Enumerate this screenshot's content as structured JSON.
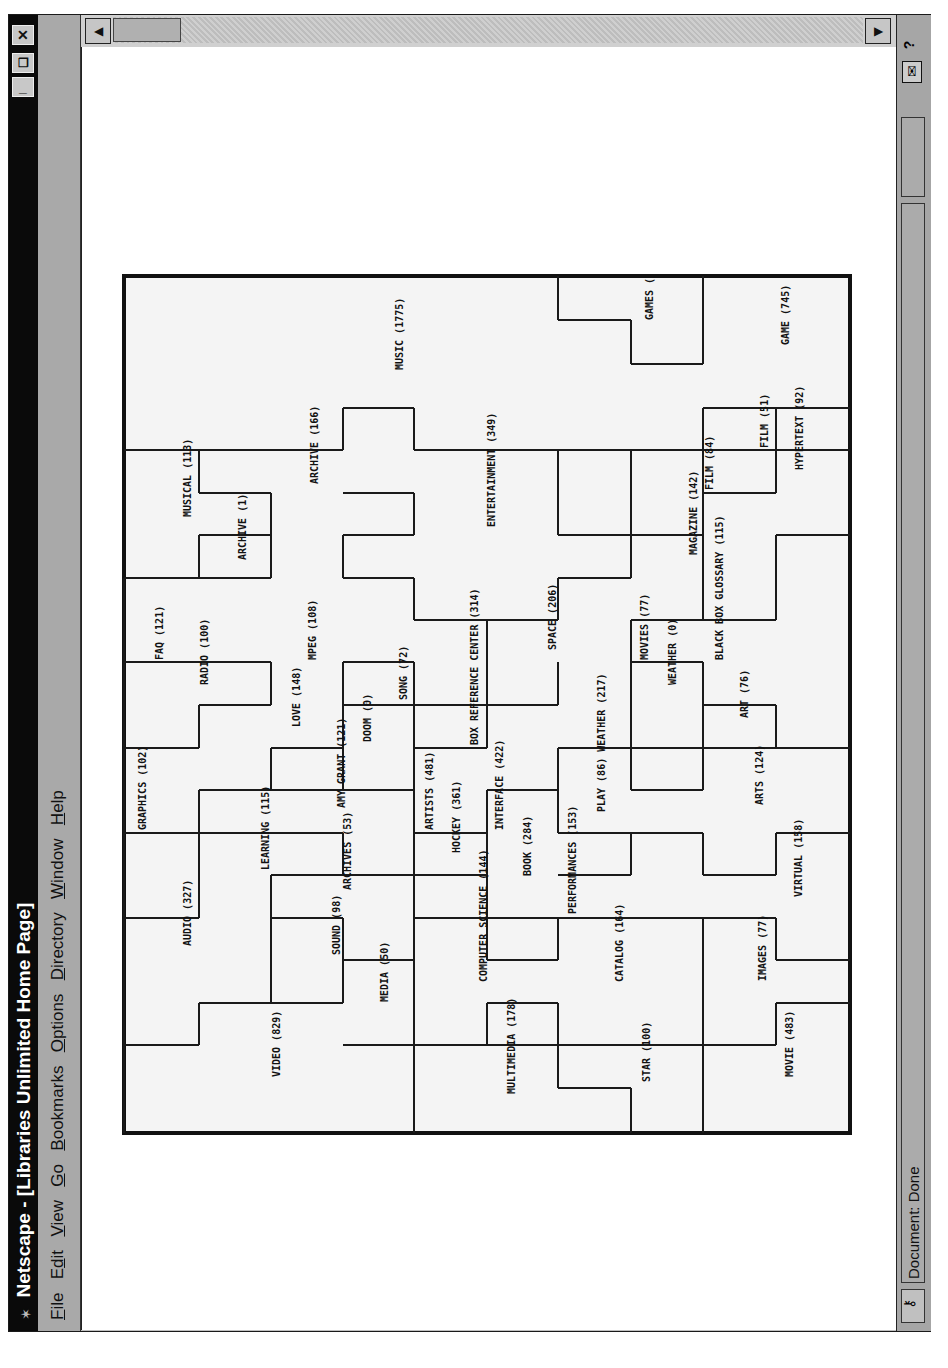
{
  "window": {
    "title": "Netscape - [Libraries Unlimited Home Page]",
    "controls": {
      "minimize": "_",
      "restore": "❐",
      "close": "✕"
    }
  },
  "menubar": {
    "items": [
      {
        "label": "File",
        "mnemonic": "F"
      },
      {
        "label": "Edit",
        "mnemonic": "d"
      },
      {
        "label": "View",
        "mnemonic": "V"
      },
      {
        "label": "Go",
        "mnemonic": "G"
      },
      {
        "label": "Bookmarks",
        "mnemonic": "B"
      },
      {
        "label": "Options",
        "mnemonic": "O"
      },
      {
        "label": "Directory",
        "mnemonic": "D"
      },
      {
        "label": "Window",
        "mnemonic": "W"
      },
      {
        "label": "Help",
        "mnemonic": "H"
      }
    ]
  },
  "statusbar": {
    "text": "Document: Done",
    "security_icon": "broken-key-icon",
    "mail_icon": "envelope-icon",
    "help_icon": "question-icon"
  },
  "scrollbar": {
    "left_arrow": "◀",
    "right_arrow": "▶"
  },
  "map": {
    "title": "Topic map",
    "colors": {
      "line": "#1a1a1a",
      "background": "#f4f4f4",
      "border": "#111111"
    },
    "labels": [
      {
        "text": "MUSIC (1775)",
        "x": 400,
        "y": 370
      },
      {
        "text": "GAMES (",
        "x": 650,
        "y": 320
      },
      {
        "text": "GAME (745)",
        "x": 786,
        "y": 345
      },
      {
        "text": "MUSICAL (113)",
        "x": 188,
        "y": 517
      },
      {
        "text": "ARCHIVE (166)",
        "x": 315,
        "y": 484
      },
      {
        "text": "ARCHIVE (1)",
        "x": 243,
        "y": 560
      },
      {
        "text": "ENTERTAINMENT (349)",
        "x": 492,
        "y": 527
      },
      {
        "text": "FILM (51)",
        "x": 765,
        "y": 448
      },
      {
        "text": "HYPERTEXT (92)",
        "x": 800,
        "y": 470
      },
      {
        "text": "FILM (84)",
        "x": 710,
        "y": 490
      },
      {
        "text": "MAGAZINE (142)",
        "x": 694,
        "y": 555
      },
      {
        "text": "BLACK BOX GLOSSARY (115)",
        "x": 720,
        "y": 660
      },
      {
        "text": "FAQ (121)",
        "x": 160,
        "y": 660
      },
      {
        "text": "RADIO (100)",
        "x": 205,
        "y": 685
      },
      {
        "text": "MPEG (108)",
        "x": 313,
        "y": 660
      },
      {
        "text": "BOX REFERENCE CENTER (314)",
        "x": 475,
        "y": 745
      },
      {
        "text": "SPACE (206)",
        "x": 553,
        "y": 650
      },
      {
        "text": "MOVIES (77)",
        "x": 645,
        "y": 660
      },
      {
        "text": "WEATHER (0)",
        "x": 673,
        "y": 685
      },
      {
        "text": "LOVE (148)",
        "x": 297,
        "y": 727
      },
      {
        "text": "SONG (72)",
        "x": 404,
        "y": 700
      },
      {
        "text": "DOOM (0)",
        "x": 368,
        "y": 742
      },
      {
        "text": "AMY GRANT (121)",
        "x": 342,
        "y": 808
      },
      {
        "text": "ART (76)",
        "x": 745,
        "y": 718
      },
      {
        "text": "PLAY (86) WEATHER (217)",
        "x": 602,
        "y": 812
      },
      {
        "text": "GRAPHICS (102)",
        "x": 143,
        "y": 830
      },
      {
        "text": "LEARNING (115)",
        "x": 266,
        "y": 870
      },
      {
        "text": "ARTISTS (481)",
        "x": 430,
        "y": 830
      },
      {
        "text": "HOCKEY (361)",
        "x": 457,
        "y": 853
      },
      {
        "text": "INTERFACE (422)",
        "x": 500,
        "y": 830
      },
      {
        "text": "ARTS (124)",
        "x": 760,
        "y": 805
      },
      {
        "text": "ARCHIVES (53)",
        "x": 348,
        "y": 890
      },
      {
        "text": "BOOK (284)",
        "x": 528,
        "y": 876
      },
      {
        "text": "PERFORMANCES (153)",
        "x": 573,
        "y": 914
      },
      {
        "text": "AUDIO (327)",
        "x": 188,
        "y": 946
      },
      {
        "text": "SOUND (98)",
        "x": 337,
        "y": 955
      },
      {
        "text": "COMPUTER SCIENCE (144)",
        "x": 484,
        "y": 982
      },
      {
        "text": "VIRTUAL (158)",
        "x": 799,
        "y": 897
      },
      {
        "text": "CATALOG (164)",
        "x": 620,
        "y": 982
      },
      {
        "text": "IMAGES (77)",
        "x": 763,
        "y": 981
      },
      {
        "text": "MEDIA (50)",
        "x": 385,
        "y": 1002
      },
      {
        "text": "VIDEO (829)",
        "x": 277,
        "y": 1077
      },
      {
        "text": "MULTIMEDIA (178)",
        "x": 512,
        "y": 1094
      },
      {
        "text": "STAR (100)",
        "x": 647,
        "y": 1082
      },
      {
        "text": "MOVIE (483)",
        "x": 790,
        "y": 1077
      }
    ],
    "segments": [
      [
        124,
        450,
        343,
        450
      ],
      [
        343,
        450,
        343,
        408
      ],
      [
        343,
        408,
        414,
        408
      ],
      [
        414,
        408,
        414,
        450
      ],
      [
        414,
        450,
        850,
        450
      ],
      [
        199,
        450,
        199,
        493
      ],
      [
        199,
        493,
        271,
        493
      ],
      [
        271,
        493,
        271,
        535
      ],
      [
        271,
        535,
        199,
        535
      ],
      [
        199,
        535,
        199,
        578
      ],
      [
        124,
        578,
        271,
        578
      ],
      [
        271,
        578,
        271,
        535
      ],
      [
        343,
        493,
        414,
        493
      ],
      [
        414,
        493,
        414,
        535
      ],
      [
        414,
        535,
        343,
        535
      ],
      [
        343,
        535,
        343,
        578
      ],
      [
        343,
        578,
        414,
        578
      ],
      [
        414,
        578,
        414,
        620
      ],
      [
        414,
        620,
        558,
        620
      ],
      [
        558,
        620,
        558,
        578
      ],
      [
        558,
        578,
        631,
        578
      ],
      [
        631,
        578,
        631,
        535
      ],
      [
        631,
        535,
        703,
        535
      ],
      [
        703,
        535,
        703,
        493
      ],
      [
        703,
        493,
        776,
        493
      ],
      [
        776,
        493,
        776,
        408
      ],
      [
        703,
        408,
        850,
        408
      ],
      [
        703,
        408,
        703,
        620
      ],
      [
        703,
        450,
        776,
        450
      ],
      [
        558,
        535,
        631,
        535
      ],
      [
        631,
        535,
        631,
        450
      ],
      [
        558,
        450,
        558,
        535
      ],
      [
        558,
        320,
        631,
        320
      ],
      [
        631,
        320,
        631,
        364
      ],
      [
        631,
        364,
        703,
        364
      ],
      [
        703,
        364,
        703,
        276
      ],
      [
        558,
        276,
        558,
        320
      ],
      [
        776,
        535,
        850,
        535
      ],
      [
        776,
        535,
        776,
        620
      ],
      [
        703,
        620,
        776,
        620
      ],
      [
        124,
        662,
        199,
        662
      ],
      [
        199,
        662,
        271,
        662
      ],
      [
        271,
        662,
        271,
        705
      ],
      [
        271,
        705,
        199,
        705
      ],
      [
        199,
        705,
        199,
        748
      ],
      [
        124,
        748,
        199,
        748
      ],
      [
        124,
        578,
        124,
        1133
      ],
      [
        343,
        662,
        414,
        662
      ],
      [
        343,
        662,
        343,
        790
      ],
      [
        343,
        705,
        414,
        705
      ],
      [
        414,
        662,
        414,
        748
      ],
      [
        414,
        748,
        487,
        748
      ],
      [
        487,
        705,
        487,
        748
      ],
      [
        487,
        705,
        558,
        705
      ],
      [
        558,
        705,
        558,
        662
      ],
      [
        414,
        705,
        487,
        705
      ],
      [
        487,
        620,
        487,
        705
      ],
      [
        631,
        620,
        631,
        748
      ],
      [
        631,
        620,
        703,
        620
      ],
      [
        631,
        662,
        703,
        662
      ],
      [
        703,
        662,
        703,
        748
      ],
      [
        703,
        705,
        776,
        705
      ],
      [
        776,
        705,
        776,
        748
      ],
      [
        776,
        748,
        850,
        748
      ],
      [
        631,
        748,
        776,
        748
      ],
      [
        199,
        790,
        271,
        790
      ],
      [
        199,
        790,
        199,
        918
      ],
      [
        271,
        790,
        343,
        790
      ],
      [
        271,
        748,
        271,
        790
      ],
      [
        271,
        748,
        343,
        748
      ],
      [
        343,
        790,
        414,
        790
      ],
      [
        414,
        748,
        414,
        1133
      ],
      [
        414,
        833,
        487,
        833
      ],
      [
        487,
        790,
        487,
        875
      ],
      [
        487,
        790,
        558,
        790
      ],
      [
        558,
        748,
        558,
        833
      ],
      [
        558,
        748,
        631,
        748
      ],
      [
        631,
        748,
        631,
        790
      ],
      [
        631,
        790,
        703,
        790
      ],
      [
        703,
        790,
        703,
        748
      ],
      [
        124,
        833,
        343,
        833
      ],
      [
        343,
        833,
        343,
        875
      ],
      [
        271,
        875,
        414,
        875
      ],
      [
        271,
        875,
        271,
        1003
      ],
      [
        271,
        918,
        343,
        918
      ],
      [
        343,
        918,
        343,
        1003
      ],
      [
        343,
        960,
        414,
        960
      ],
      [
        199,
        918,
        124,
        918
      ],
      [
        414,
        875,
        487,
        875
      ],
      [
        487,
        875,
        487,
        960
      ],
      [
        487,
        960,
        558,
        960
      ],
      [
        558,
        918,
        558,
        960
      ],
      [
        558,
        833,
        703,
        833
      ],
      [
        558,
        875,
        631,
        875
      ],
      [
        631,
        833,
        631,
        875
      ],
      [
        703,
        833,
        703,
        875
      ],
      [
        703,
        875,
        776,
        875
      ],
      [
        776,
        833,
        776,
        875
      ],
      [
        776,
        833,
        850,
        833
      ],
      [
        414,
        918,
        703,
        918
      ],
      [
        703,
        918,
        703,
        1133
      ],
      [
        703,
        918,
        776,
        918
      ],
      [
        776,
        918,
        776,
        960
      ],
      [
        776,
        960,
        850,
        960
      ],
      [
        124,
        1045,
        199,
        1045
      ],
      [
        199,
        1003,
        199,
        1045
      ],
      [
        199,
        1003,
        343,
        1003
      ],
      [
        343,
        1045,
        414,
        1045
      ],
      [
        414,
        1045,
        487,
        1045
      ],
      [
        487,
        1003,
        487,
        1045
      ],
      [
        487,
        1003,
        558,
        1003
      ],
      [
        558,
        1003,
        558,
        1088
      ],
      [
        558,
        1088,
        631,
        1088
      ],
      [
        631,
        1088,
        631,
        1133
      ],
      [
        414,
        1045,
        776,
        1045
      ],
      [
        776,
        1003,
        776,
        1045
      ],
      [
        776,
        1003,
        850,
        1003
      ]
    ]
  }
}
